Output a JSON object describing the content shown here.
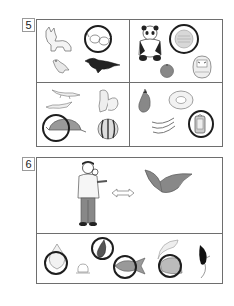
{
  "question5": {
    "number": "5",
    "quadrants": [
      {
        "position": "top-left",
        "items": [
          "fox",
          "glasses",
          "sparrow",
          "crow"
        ],
        "circled": [
          "glasses"
        ]
      },
      {
        "position": "top-right",
        "items": [
          "panda",
          "circular-object",
          "apple",
          "daruma-doll"
        ],
        "circled": [
          "circular-object"
        ]
      },
      {
        "position": "bottom-left",
        "items": [
          "lizard",
          "lizard",
          "squirrel",
          "turtle",
          "watermelon"
        ],
        "circled": [
          "turtle"
        ]
      },
      {
        "position": "bottom-right",
        "items": [
          "eggplant",
          "donut",
          "bananas",
          "lantern"
        ],
        "circled": [
          "lantern"
        ]
      }
    ]
  },
  "question6": {
    "number": "6",
    "top": {
      "items": [
        "man-with-glasses",
        "double-arrow",
        "bird-flying"
      ]
    },
    "bottom": {
      "items": [
        "onion",
        "rice-ball",
        "eggplant",
        "fish",
        "moon-cheese",
        "feather"
      ],
      "circled": [
        "onion",
        "eggplant",
        "fish",
        "cheese"
      ]
    }
  },
  "colors": {
    "frame": "#6e6e6e",
    "circle": "#1e1e1e",
    "label_border": "#9a9a9a"
  }
}
